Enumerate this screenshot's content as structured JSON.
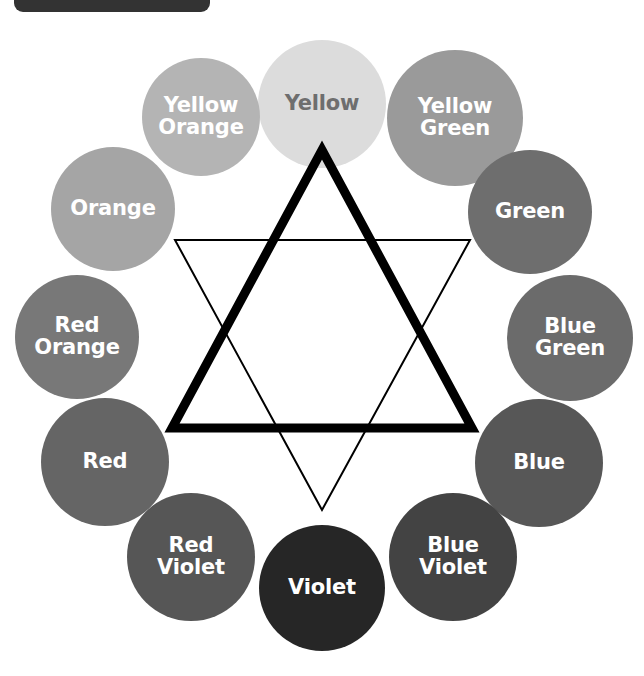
{
  "page": {
    "background_color": "#ffffff",
    "title_tab": {
      "name": "top-left-tab",
      "color": "#333333",
      "label": ""
    }
  },
  "diagram": {
    "name": "color-wheel-with-star",
    "star": {
      "primary_triangle": {
        "label": "primary-triangle",
        "stroke_color": "#000000",
        "stroke_width": 9,
        "points": "322,150 472,428 172,428",
        "connects": [
          "Yellow",
          "Blue",
          "Red"
        ]
      },
      "secondary_triangle": {
        "label": "secondary-triangle",
        "stroke_color": "#000000",
        "stroke_width": 2,
        "points": "175,240 470,240 322,510",
        "connects": [
          "Orange",
          "Green",
          "Violet"
        ]
      }
    },
    "swatches": [
      {
        "label": "Yellow",
        "multiline": "Yellow",
        "color": "#dcdcdc",
        "text_color": "#6e6e6e",
        "cx": 322,
        "cy": 104,
        "r": 64,
        "font_size": 21,
        "position": "top",
        "role": "primary"
      },
      {
        "label": "Yellow Green",
        "multiline": "Yellow\nGreen",
        "color": "#9a9a9a",
        "text_color": "#ffffff",
        "cx": 455,
        "cy": 118,
        "r": 68,
        "font_size": 21,
        "position": "top-right",
        "role": "tertiary"
      },
      {
        "label": "Green",
        "multiline": "Green",
        "color": "#6e6e6e",
        "text_color": "#ffffff",
        "cx": 530,
        "cy": 212,
        "r": 62,
        "font_size": 21,
        "position": "right-upper",
        "role": "secondary"
      },
      {
        "label": "Blue Green",
        "multiline": "Blue\nGreen",
        "color": "#6b6b6b",
        "text_color": "#ffffff",
        "cx": 570,
        "cy": 338,
        "r": 63,
        "font_size": 21,
        "position": "right",
        "role": "tertiary"
      },
      {
        "label": "Blue",
        "multiline": "Blue",
        "color": "#575757",
        "text_color": "#ffffff",
        "cx": 539,
        "cy": 463,
        "r": 64,
        "font_size": 21,
        "position": "right-lower",
        "role": "primary"
      },
      {
        "label": "Blue Violet",
        "multiline": "Blue\nViolet",
        "color": "#434343",
        "text_color": "#ffffff",
        "cx": 453,
        "cy": 557,
        "r": 64,
        "font_size": 21,
        "position": "bottom-right",
        "role": "tertiary"
      },
      {
        "label": "Violet",
        "multiline": "Violet",
        "color": "#262626",
        "text_color": "#ffffff",
        "cx": 322,
        "cy": 588,
        "r": 63,
        "font_size": 21,
        "position": "bottom",
        "role": "secondary"
      },
      {
        "label": "Red Violet",
        "multiline": "Red\nViolet",
        "color": "#565656",
        "text_color": "#ffffff",
        "cx": 191,
        "cy": 557,
        "r": 64,
        "font_size": 21,
        "position": "bottom-left",
        "role": "tertiary"
      },
      {
        "label": "Red",
        "multiline": "Red",
        "color": "#656565",
        "text_color": "#ffffff",
        "cx": 105,
        "cy": 462,
        "r": 64,
        "font_size": 21,
        "position": "left-lower",
        "role": "primary"
      },
      {
        "label": "Red Orange",
        "multiline": "Red\nOrange",
        "color": "#787878",
        "text_color": "#ffffff",
        "cx": 77,
        "cy": 337,
        "r": 62,
        "font_size": 21,
        "position": "left",
        "role": "tertiary"
      },
      {
        "label": "Orange",
        "multiline": "Orange",
        "color": "#a5a5a5",
        "text_color": "#ffffff",
        "cx": 113,
        "cy": 209,
        "r": 62,
        "font_size": 21,
        "position": "left-upper",
        "role": "secondary"
      },
      {
        "label": "Yellow Orange",
        "multiline": "Yellow\nOrange",
        "color": "#b4b4b4",
        "text_color": "#ffffff",
        "cx": 201,
        "cy": 117,
        "r": 59,
        "font_size": 21,
        "position": "top-left",
        "role": "tertiary"
      }
    ]
  }
}
